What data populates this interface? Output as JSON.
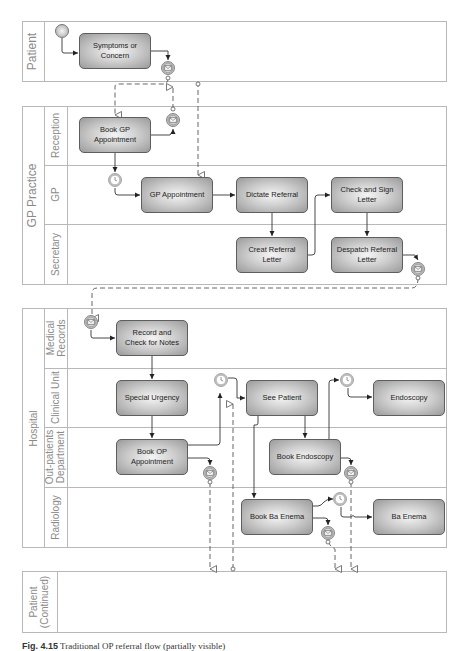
{
  "diagram": {
    "type": "BPMN swimlane process diagram",
    "colors": {
      "pool_border": "#b8b8b8",
      "label_text": "#8a8a8a",
      "task_border": "#5e5e5e",
      "task_fill_center": "#f4f4f4",
      "task_fill_edge": "#9a9a9a",
      "flow_line": "#333333",
      "message_line": "#555555"
    }
  },
  "pools": [
    {
      "id": "patient",
      "label": "Patient",
      "lanes": []
    },
    {
      "id": "gp_practice",
      "label": "GP Practice",
      "lanes": [
        {
          "label": "Reception"
        },
        {
          "label": "GP"
        },
        {
          "label": "Secretary"
        }
      ]
    },
    {
      "id": "hospital",
      "label": "Hospital",
      "lanes": [
        {
          "label": "Medical\nRecords"
        },
        {
          "label": "Clinical Unit"
        },
        {
          "label": "Out-patients\nDepartment"
        },
        {
          "label": "Radiology"
        }
      ]
    },
    {
      "id": "patient_continued",
      "label": "Patient\n(Continued)",
      "lanes": []
    }
  ],
  "tasks": {
    "symptoms": "Symptoms or Concern",
    "book_gp": "Book GP Appointment",
    "gp_appointment": "GP Appointment",
    "dictate_referral": "Dictate Referral",
    "check_sign": "Check and Sign Letter",
    "creat_referral": "Creat Referral Letter",
    "despatch_referral": "Despatch Referral Letter",
    "record_check": "Record and Check for Notes",
    "special_urgency": "Special Urgency",
    "see_patient": "See Patient",
    "endoscopy": "Endoscopy",
    "book_op": "Book OP Appointment",
    "book_endoscopy": "Book Endoscopy",
    "book_ba_enema": "Book Ba Enema",
    "ba_enema": "Ba Enema"
  },
  "events": [
    {
      "type": "start",
      "lane": "Patient"
    },
    {
      "type": "message",
      "lane": "Patient"
    },
    {
      "type": "message",
      "lane": "Reception"
    },
    {
      "type": "timer",
      "lane": "GP"
    },
    {
      "type": "message",
      "lane": "Secretary"
    },
    {
      "type": "message",
      "lane": "Medical Records"
    },
    {
      "type": "timer",
      "lane": "Clinical Unit"
    },
    {
      "type": "timer",
      "lane": "Clinical Unit"
    },
    {
      "type": "message",
      "lane": "Out-patients Department"
    },
    {
      "type": "message",
      "lane": "Out-patients Department"
    },
    {
      "type": "timer",
      "lane": "Radiology"
    },
    {
      "type": "message",
      "lane": "Radiology"
    }
  ],
  "caption": {
    "prefix": "Fig. 4.15",
    "text": "Traditional OP referral flow (partially visible)"
  }
}
